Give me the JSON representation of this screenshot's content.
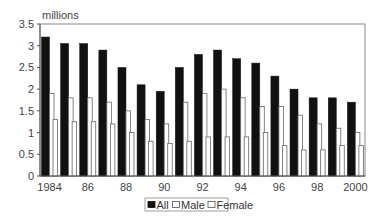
{
  "chart_data": {
    "type": "bar",
    "title": "",
    "unit_label": "millions",
    "xlabel": "",
    "ylabel": "millions",
    "ylim": [
      0,
      3.5
    ],
    "yticks": [
      "0",
      "0.5",
      "1",
      "1.5",
      "2",
      "2.5",
      "3",
      "3.5"
    ],
    "categories": [
      "1984",
      "1985",
      "1986",
      "1987",
      "1988",
      "1989",
      "1990",
      "1991",
      "1992",
      "1993",
      "1994",
      "1995",
      "1996",
      "1997",
      "1998",
      "1999",
      "2000"
    ],
    "xtick_labels": [
      "1984",
      "",
      "86",
      "",
      "88",
      "",
      "90",
      "",
      "92",
      "",
      "94",
      "",
      "96",
      "",
      "98",
      "",
      "2000"
    ],
    "series": [
      {
        "name": "All",
        "color": "#111111",
        "values": [
          3.2,
          3.05,
          3.05,
          2.9,
          2.5,
          2.1,
          1.95,
          2.5,
          2.8,
          2.9,
          2.7,
          2.6,
          2.3,
          2.0,
          1.8,
          1.8,
          1.7
        ]
      },
      {
        "name": "Male",
        "color": "#ffffff",
        "values": [
          1.9,
          1.8,
          1.8,
          1.7,
          1.5,
          1.3,
          1.2,
          1.7,
          1.9,
          2.0,
          1.8,
          1.6,
          1.6,
          1.4,
          1.2,
          1.1,
          1.0
        ]
      },
      {
        "name": "Female",
        "color": "#ffffff",
        "values": [
          1.3,
          1.25,
          1.25,
          1.2,
          1.0,
          0.8,
          0.75,
          0.8,
          0.9,
          0.9,
          0.9,
          1.0,
          0.7,
          0.6,
          0.6,
          0.7,
          0.7
        ]
      }
    ],
    "grid": false,
    "legend_position": "bottom"
  }
}
